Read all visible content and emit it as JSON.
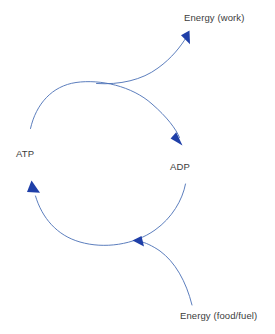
{
  "diagram": {
    "stroke_color": "#4a6fb5",
    "arrow_fill_color": "#1f3fa8",
    "text_color": "#3c3c3c",
    "background_color": "#ffffff",
    "nodes": [
      {
        "id": "atp",
        "label": "ATP"
      },
      {
        "id": "adp",
        "label": "ADP"
      },
      {
        "id": "energy_work",
        "label": "Energy (work)"
      },
      {
        "id": "energy_food",
        "label": "Energy (food/fuel)"
      }
    ],
    "edges": [
      {
        "id": "atp-to-adp",
        "from": "ATP",
        "to": "ADP",
        "shape": "arc",
        "direction": "clockwise-top",
        "arrowhead": "end"
      },
      {
        "id": "adp-to-atp",
        "from": "ADP",
        "to": "ATP",
        "shape": "arc",
        "direction": "clockwise-bottom",
        "arrowhead": "end"
      },
      {
        "id": "release-to-work",
        "from": "ATP",
        "to": "Energy (work)",
        "shape": "curve",
        "direction": "up-right",
        "arrowhead": "end"
      },
      {
        "id": "food-to-cycle",
        "from": "Energy (food/fuel)",
        "to": "ADP",
        "shape": "curve",
        "direction": "up-left",
        "arrowhead": "end"
      }
    ]
  }
}
